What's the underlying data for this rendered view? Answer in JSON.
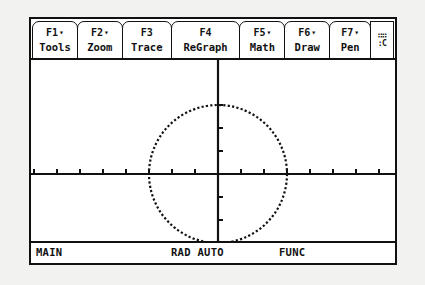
{
  "device": {
    "screen_label": "graphing-calculator-screen"
  },
  "toolbar": {
    "buttons": [
      {
        "fkey": "F1",
        "label": "Tools",
        "has_menu_arrow": true,
        "icon": "chevron-down-icon"
      },
      {
        "fkey": "F2",
        "label": "Zoom",
        "has_menu_arrow": true,
        "icon": "chevron-down-icon"
      },
      {
        "fkey": "F3",
        "label": "Trace",
        "has_menu_arrow": false,
        "icon": ""
      },
      {
        "fkey": "F4",
        "label": "ReGraph",
        "has_menu_arrow": false,
        "icon": ""
      },
      {
        "fkey": "F5",
        "label": "Math",
        "has_menu_arrow": true,
        "icon": "chevron-down-icon"
      },
      {
        "fkey": "F6",
        "label": "Draw",
        "has_menu_arrow": true,
        "icon": "chevron-down-icon"
      },
      {
        "fkey": "F7",
        "label": "Pen",
        "has_menu_arrow": true,
        "icon": "chevron-down-icon"
      }
    ],
    "arrow_glyph": "▾",
    "indicator": {
      "name": "busy-indicator",
      "row1": "∷∷",
      "row2": ":C"
    }
  },
  "status_bar": {
    "main": "MAIN",
    "mode": "RAD AUTO",
    "graph_mode": "FUNC"
  },
  "chart_data": {
    "type": "line",
    "title": "",
    "xlabel": "",
    "ylabel": "",
    "grid": false,
    "legend": null,
    "axes": {
      "x_axis_visible": true,
      "y_axis_visible": true,
      "origin_px": {
        "x": 187,
        "y": 114
      },
      "tick_spacing_px": 23,
      "tick_length_px": 5,
      "x_tick_count_left": 8,
      "x_tick_count_right": 8,
      "y_tick_count_up": 3,
      "y_tick_count_down": 3
    },
    "series": [
      {
        "name": "circle",
        "shape": "circle",
        "center": {
          "x": 0,
          "y": 0
        },
        "radius_units": 3,
        "radius_px": 69,
        "stroke": "#111111",
        "dotted": true
      }
    ],
    "xlim": [
      -8,
      8
    ],
    "ylim": [
      -3,
      3
    ]
  },
  "colors": {
    "ink": "#111111",
    "screen_bg": "#ffffff",
    "page_bg": "#f2f2f0"
  }
}
